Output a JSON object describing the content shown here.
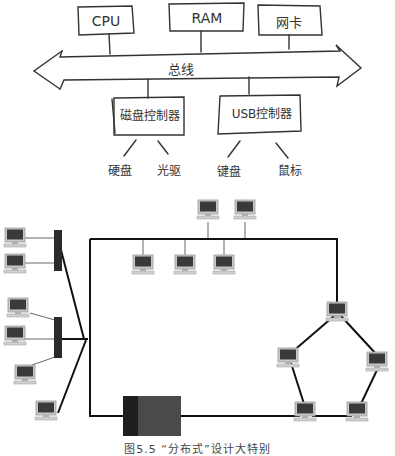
{
  "bus_diagram": {
    "top_boxes": [
      {
        "id": "cpu",
        "label": "CPU"
      },
      {
        "id": "ram",
        "label": "RAM"
      },
      {
        "id": "nic",
        "label": "网卡"
      }
    ],
    "bus_label": "总线",
    "controllers": [
      {
        "id": "disk-controller",
        "label": "磁盘控制器",
        "devices": [
          "硬盘",
          "光驱"
        ]
      },
      {
        "id": "usb-controller",
        "label": "USB控制器",
        "devices": [
          "键盘",
          "鼠标"
        ]
      }
    ]
  },
  "network_diagram": {
    "caption": "图5.5 “分布式”设计大特别",
    "colors": {
      "line": "#111111",
      "hub": "#2a2a2a",
      "server_dark": "#1e1e1e",
      "server_body": "#4a4a4a",
      "monitor_screen": "#3a3a3a",
      "monitor_frame": "#bdbdbd"
    }
  }
}
